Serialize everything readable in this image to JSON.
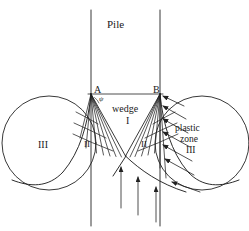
{
  "figure": {
    "stroke_color": "#222222",
    "background_color": "#ffffff"
  },
  "labels": {
    "pile": "Pile",
    "point_a": "A",
    "point_b": "B",
    "angle_psi": "ψ",
    "wedge": "wedge",
    "wedge_numeral": "I",
    "fan_left_numeral": "II",
    "fan_right_numeral": "II",
    "plastic_zone_left_numeral": "III",
    "plastic_word": "plastic",
    "zone_word": "zone",
    "plastic_zone_right_numeral": "III"
  },
  "geometry": {
    "pile_left_wall_x": 91,
    "pile_right_wall_x": 160,
    "pile_top_y": 10,
    "pile_bottom_y": 226,
    "point_a": [
      91,
      94
    ],
    "point_b": [
      160,
      94
    ],
    "wedge_apex": [
      125.5,
      156
    ],
    "left_circle": {
      "cx": 49,
      "cy": 143,
      "r": 47
    },
    "right_circle": {
      "cx": 202,
      "cy": 143,
      "r": 47
    },
    "left_fan_rays": 7,
    "right_fan_rays": 7,
    "fan_arcs": 3,
    "right_load_arrows": 7,
    "bottom_vertical_arrows": 3
  }
}
